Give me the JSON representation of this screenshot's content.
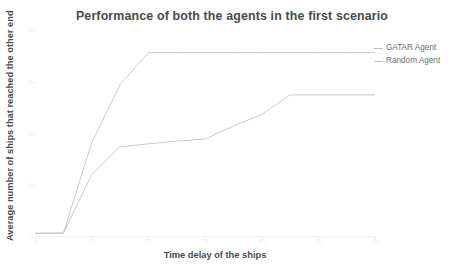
{
  "chart_data": {
    "type": "line",
    "title": "Performance of both the agents in the first scenario",
    "xlabel": "Time delay of the ships",
    "ylabel": "Average number of ships that reached the other end",
    "x": [
      0,
      1,
      2,
      3,
      4,
      5,
      6,
      7,
      8,
      9,
      10,
      11,
      12
    ],
    "xtick_labels": [
      "0",
      "10",
      "20",
      "30",
      "40",
      "50",
      "60"
    ],
    "ytick_labels": [
      "0",
      "5",
      "10",
      "15",
      "20"
    ],
    "ylim": [
      0,
      22
    ],
    "xlim": [
      0,
      12
    ],
    "grid": false,
    "legend_position": "top-right",
    "series": [
      {
        "name": "GATAR Agent",
        "color": "#c4c4c4",
        "values": [
          0.4,
          0.4,
          10.0,
          16.2,
          19.6,
          19.6,
          19.6,
          19.6,
          19.6,
          19.6,
          19.6,
          19.6,
          19.6
        ]
      },
      {
        "name": "Random Agent",
        "color": "#c4c4c4",
        "values": [
          0.4,
          0.4,
          6.6,
          9.6,
          9.9,
          10.2,
          10.4,
          11.8,
          13.0,
          15.1,
          15.1,
          15.1,
          15.1
        ]
      }
    ]
  },
  "legend": {
    "items": [
      {
        "label": "GATAR Agent"
      },
      {
        "label": "Random Agent"
      }
    ]
  }
}
